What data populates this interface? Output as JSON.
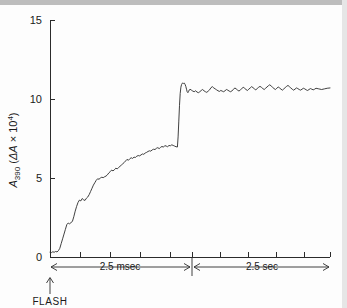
{
  "figure": {
    "background": "#fdfdfd",
    "ink_color": "#2b2b2b"
  },
  "axes": {
    "y_label_main": "A",
    "y_label_sub": "390",
    "y_label_paren_open": " (",
    "y_label_delta": "ΔA",
    "y_label_times": " × 10",
    "y_label_exp": "4",
    "y_label_paren_close": ")",
    "y_ticks": [
      "0",
      "5",
      "10",
      "15"
    ],
    "y_tick_values": [
      0,
      5,
      10,
      15
    ],
    "y_range": [
      0,
      15
    ]
  },
  "annotations": {
    "segment1_label": "2.5 msec",
    "segment2_label": "2.5 sec",
    "flash_label": "FLASH"
  },
  "chart_data": {
    "type": "line",
    "title": "",
    "xlabel": "",
    "ylabel": "A390 (ΔA × 10^4)",
    "ylim": [
      0,
      15
    ],
    "grid": false,
    "legend": false,
    "x_axis_style": "broken-two-segment",
    "segments": [
      {
        "name": "fast phase",
        "span_label": "2.5 msec",
        "duration_value": 2.5,
        "duration_unit": "msec",
        "x_pixel_start": 50,
        "x_pixel_end": 192,
        "tick_positions_px": [
          50,
          80,
          110,
          140,
          170,
          192
        ],
        "n_ticks": 6
      },
      {
        "name": "slow phase",
        "span_label": "2.5 sec",
        "duration_value": 2.5,
        "duration_unit": "sec",
        "x_pixel_start": 192,
        "x_pixel_end": 330,
        "tick_positions_px": [
          192,
          220,
          248,
          276,
          304,
          330
        ],
        "n_ticks": 6
      }
    ],
    "series": [
      {
        "name": "A390 kinetics",
        "color": "#2b2b2b",
        "description": "Absorbance rise after flash: noisy near-linear climb to ~7 over the 2.5 msec segment, then a sharp jump to ~11 at the segment break, small overshoot, settling to a noisy plateau near 10.7 over the 2.5 sec segment.",
        "points": [
          [
            0.0,
            0.3
          ],
          [
            0.01,
            0.28
          ],
          [
            0.02,
            0.33
          ],
          [
            0.03,
            0.3
          ],
          [
            0.04,
            0.35
          ],
          [
            0.05,
            0.32
          ],
          [
            0.06,
            0.4
          ],
          [
            0.07,
            0.55
          ],
          [
            0.08,
            0.85
          ],
          [
            0.09,
            1.15
          ],
          [
            0.1,
            1.45
          ],
          [
            0.11,
            1.75
          ],
          [
            0.12,
            2.05
          ],
          [
            0.13,
            2.15
          ],
          [
            0.14,
            2.1
          ],
          [
            0.15,
            2.18
          ],
          [
            0.16,
            2.25
          ],
          [
            0.17,
            2.55
          ],
          [
            0.18,
            2.9
          ],
          [
            0.19,
            3.2
          ],
          [
            0.2,
            3.45
          ],
          [
            0.21,
            3.6
          ],
          [
            0.22,
            3.55
          ],
          [
            0.23,
            3.7
          ],
          [
            0.24,
            3.62
          ],
          [
            0.25,
            3.58
          ],
          [
            0.26,
            3.72
          ],
          [
            0.27,
            3.8
          ],
          [
            0.28,
            3.95
          ],
          [
            0.29,
            4.15
          ],
          [
            0.3,
            4.35
          ],
          [
            0.31,
            4.55
          ],
          [
            0.32,
            4.7
          ],
          [
            0.33,
            4.85
          ],
          [
            0.34,
            4.95
          ],
          [
            0.35,
            4.92
          ],
          [
            0.36,
            5.0
          ],
          [
            0.37,
            5.05
          ],
          [
            0.38,
            5.02
          ],
          [
            0.39,
            5.08
          ],
          [
            0.4,
            5.12
          ],
          [
            0.41,
            5.2
          ],
          [
            0.42,
            5.32
          ],
          [
            0.43,
            5.4
          ],
          [
            0.44,
            5.5
          ],
          [
            0.45,
            5.45
          ],
          [
            0.46,
            5.52
          ],
          [
            0.47,
            5.62
          ],
          [
            0.48,
            5.58
          ],
          [
            0.49,
            5.66
          ],
          [
            0.5,
            5.74
          ],
          [
            0.51,
            5.82
          ],
          [
            0.52,
            5.9
          ],
          [
            0.53,
            5.98
          ],
          [
            0.54,
            6.08
          ],
          [
            0.55,
            6.18
          ],
          [
            0.56,
            6.12
          ],
          [
            0.57,
            6.22
          ],
          [
            0.58,
            6.28
          ],
          [
            0.59,
            6.24
          ],
          [
            0.6,
            6.32
          ],
          [
            0.61,
            6.3
          ],
          [
            0.62,
            6.38
          ],
          [
            0.63,
            6.42
          ],
          [
            0.64,
            6.4
          ],
          [
            0.65,
            6.46
          ],
          [
            0.66,
            6.52
          ],
          [
            0.67,
            6.5
          ],
          [
            0.68,
            6.58
          ],
          [
            0.69,
            6.62
          ],
          [
            0.7,
            6.68
          ],
          [
            0.71,
            6.72
          ],
          [
            0.72,
            6.7
          ],
          [
            0.73,
            6.78
          ],
          [
            0.74,
            6.82
          ],
          [
            0.75,
            6.8
          ],
          [
            0.76,
            6.88
          ],
          [
            0.77,
            6.92
          ],
          [
            0.78,
            6.86
          ],
          [
            0.79,
            6.94
          ],
          [
            0.8,
            7.0
          ],
          [
            0.81,
            6.95
          ],
          [
            0.82,
            7.05
          ],
          [
            0.83,
            7.02
          ],
          [
            0.84,
            6.98
          ],
          [
            0.85,
            7.06
          ],
          [
            0.86,
            7.04
          ],
          [
            0.87,
            7.1
          ],
          [
            0.88,
            7.06
          ],
          [
            0.89,
            7.02
          ],
          [
            0.9,
            6.98
          ],
          [
            0.91,
            6.96
          ],
          [
            0.915,
            7.6
          ],
          [
            0.92,
            8.6
          ],
          [
            0.925,
            9.6
          ],
          [
            0.93,
            10.35
          ],
          [
            0.935,
            10.75
          ],
          [
            0.94,
            10.92
          ],
          [
            0.945,
            11.0
          ],
          [
            0.95,
            11.02
          ],
          [
            0.955,
            10.98
          ],
          [
            0.96,
            11.0
          ],
          [
            0.965,
            10.92
          ],
          [
            0.97,
            10.8
          ],
          [
            0.975,
            10.62
          ],
          [
            0.98,
            10.45
          ],
          [
            0.985,
            10.4
          ],
          [
            0.99,
            10.48
          ],
          [
            0.995,
            10.58
          ],
          [
            1.0,
            10.62
          ],
          [
            1.01,
            10.56
          ],
          [
            1.02,
            10.5
          ],
          [
            1.03,
            10.46
          ],
          [
            1.04,
            10.52
          ],
          [
            1.05,
            10.44
          ],
          [
            1.06,
            10.4
          ],
          [
            1.07,
            10.46
          ],
          [
            1.08,
            10.54
          ],
          [
            1.09,
            10.6
          ],
          [
            1.1,
            10.52
          ],
          [
            1.11,
            10.46
          ],
          [
            1.12,
            10.42
          ],
          [
            1.13,
            10.5
          ],
          [
            1.14,
            10.58
          ],
          [
            1.15,
            10.72
          ],
          [
            1.16,
            10.78
          ],
          [
            1.17,
            10.7
          ],
          [
            1.18,
            10.64
          ],
          [
            1.19,
            10.58
          ],
          [
            1.2,
            10.52
          ],
          [
            1.21,
            10.48
          ],
          [
            1.22,
            10.54
          ],
          [
            1.23,
            10.5
          ],
          [
            1.24,
            10.46
          ],
          [
            1.25,
            10.52
          ],
          [
            1.26,
            10.6
          ],
          [
            1.27,
            10.56
          ],
          [
            1.28,
            10.5
          ],
          [
            1.29,
            10.46
          ],
          [
            1.3,
            10.52
          ],
          [
            1.31,
            10.6
          ],
          [
            1.32,
            10.7
          ],
          [
            1.33,
            10.64
          ],
          [
            1.34,
            10.56
          ],
          [
            1.35,
            10.5
          ],
          [
            1.36,
            10.58
          ],
          [
            1.37,
            10.66
          ],
          [
            1.38,
            10.74
          ],
          [
            1.39,
            10.68
          ],
          [
            1.4,
            10.6
          ],
          [
            1.41,
            10.54
          ],
          [
            1.42,
            10.62
          ],
          [
            1.43,
            10.7
          ],
          [
            1.44,
            10.78
          ],
          [
            1.45,
            10.72
          ],
          [
            1.46,
            10.64
          ],
          [
            1.47,
            10.58
          ],
          [
            1.48,
            10.66
          ],
          [
            1.49,
            10.74
          ],
          [
            1.5,
            10.8
          ],
          [
            1.51,
            10.74
          ],
          [
            1.52,
            10.66
          ],
          [
            1.53,
            10.6
          ],
          [
            1.54,
            10.68
          ],
          [
            1.55,
            10.76
          ],
          [
            1.56,
            10.84
          ],
          [
            1.57,
            10.9
          ],
          [
            1.58,
            10.82
          ],
          [
            1.59,
            10.74
          ],
          [
            1.6,
            10.66
          ],
          [
            1.61,
            10.6
          ],
          [
            1.62,
            10.68
          ],
          [
            1.63,
            10.76
          ],
          [
            1.64,
            10.7
          ],
          [
            1.65,
            10.62
          ],
          [
            1.66,
            10.56
          ],
          [
            1.67,
            10.64
          ],
          [
            1.68,
            10.72
          ],
          [
            1.69,
            10.8
          ],
          [
            1.7,
            10.86
          ],
          [
            1.71,
            10.78
          ],
          [
            1.72,
            10.7
          ],
          [
            1.73,
            10.62
          ],
          [
            1.74,
            10.56
          ],
          [
            1.75,
            10.62
          ],
          [
            1.76,
            10.7
          ],
          [
            1.77,
            10.66
          ],
          [
            1.78,
            10.6
          ],
          [
            1.79,
            10.56
          ],
          [
            1.8,
            10.62
          ],
          [
            1.81,
            10.68
          ],
          [
            1.82,
            10.64
          ],
          [
            1.83,
            10.58
          ],
          [
            1.84,
            10.54
          ],
          [
            1.85,
            10.6
          ],
          [
            1.86,
            10.66
          ],
          [
            1.87,
            10.62
          ],
          [
            1.88,
            10.58
          ],
          [
            1.89,
            10.62
          ],
          [
            1.9,
            10.68
          ],
          [
            1.92,
            10.64
          ],
          [
            1.94,
            10.6
          ],
          [
            1.96,
            10.64
          ],
          [
            1.98,
            10.68
          ],
          [
            2.0,
            10.7
          ]
        ]
      }
    ]
  }
}
